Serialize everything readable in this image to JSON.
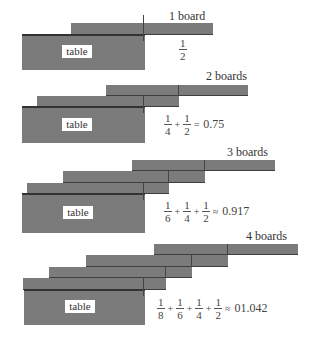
{
  "diagram": {
    "block_color": "#7b7b7b",
    "panels": [
      {
        "id": "panel-1",
        "caption": "1 board",
        "table_label": "table",
        "boards": [
          {
            "x": 71,
            "y": 23,
            "w": 142,
            "h": 12
          }
        ],
        "table": {
          "x": 22,
          "y": 35,
          "w": 123,
          "h": 35
        },
        "label_box": {
          "x": 62,
          "y": 45,
          "w": 30,
          "h": 13
        },
        "caption_pos": {
          "x": 169,
          "y": 10
        },
        "formula": {
          "terms": [
            [
              "1",
              "2"
            ]
          ],
          "operator": "",
          "result": ""
        },
        "formula_pos": {
          "x": 178,
          "y": 37
        }
      },
      {
        "id": "panel-2",
        "caption": "2 boards",
        "table_label": "table",
        "boards": [
          {
            "x": 106,
            "y": 85,
            "w": 142,
            "h": 11
          },
          {
            "x": 37,
            "y": 96,
            "w": 142,
            "h": 11
          }
        ],
        "table": {
          "x": 22,
          "y": 107,
          "w": 123,
          "h": 36
        },
        "label_box": {
          "x": 62,
          "y": 118,
          "w": 30,
          "h": 13
        },
        "caption_pos": {
          "x": 206,
          "y": 70
        },
        "formula": {
          "terms": [
            [
              "1",
              "4"
            ],
            [
              "1",
              "2"
            ]
          ],
          "operator": "=",
          "result": "0.75"
        },
        "formula_pos": {
          "x": 163,
          "y": 112
        }
      },
      {
        "id": "panel-3",
        "caption": "3 boards",
        "table_label": "table",
        "boards": [
          {
            "x": 132,
            "y": 160,
            "w": 143,
            "h": 11
          },
          {
            "x": 63,
            "y": 171,
            "w": 142,
            "h": 12
          },
          {
            "x": 27,
            "y": 183,
            "w": 142,
            "h": 11
          }
        ],
        "table": {
          "x": 22,
          "y": 194,
          "w": 123,
          "h": 39
        },
        "label_box": {
          "x": 63,
          "y": 206,
          "w": 30,
          "h": 13
        },
        "caption_pos": {
          "x": 227,
          "y": 146
        },
        "formula": {
          "terms": [
            [
              "1",
              "6"
            ],
            [
              "1",
              "4"
            ],
            [
              "1",
              "2"
            ]
          ],
          "operator": "≈",
          "result": "0.917"
        },
        "formula_pos": {
          "x": 163,
          "y": 199
        }
      },
      {
        "id": "panel-4",
        "caption": "4 boards",
        "table_label": "table",
        "boards": [
          {
            "x": 154,
            "y": 244,
            "w": 144,
            "h": 11
          },
          {
            "x": 86,
            "y": 255,
            "w": 142,
            "h": 12
          },
          {
            "x": 49,
            "y": 267,
            "w": 143,
            "h": 11
          },
          {
            "x": 23,
            "y": 278,
            "w": 143,
            "h": 12
          }
        ],
        "table": {
          "x": 24,
          "y": 290,
          "w": 121,
          "h": 35
        },
        "label_box": {
          "x": 65,
          "y": 300,
          "w": 30,
          "h": 13
        },
        "caption_pos": {
          "x": 246,
          "y": 230
        },
        "formula": {
          "terms": [
            [
              "1",
              "8"
            ],
            [
              "1",
              "6"
            ],
            [
              "1",
              "4"
            ],
            [
              "1",
              "2"
            ]
          ],
          "operator": "≈",
          "result": "01.042"
        },
        "formula_pos": {
          "x": 156,
          "y": 296
        }
      }
    ]
  }
}
